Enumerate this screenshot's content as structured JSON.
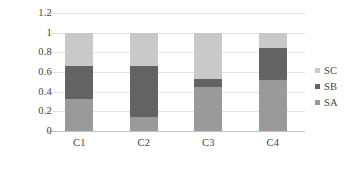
{
  "chart_data": {
    "type": "bar",
    "subtype": "stacked-bar",
    "title": "",
    "subtitle": "",
    "xlabel": "",
    "ylabel": "",
    "categories": [
      "C1",
      "C2",
      "C3",
      "C4"
    ],
    "series": [
      {
        "name": "SA",
        "color": "#9a9a9a",
        "values": [
          0.33,
          0.14,
          0.45,
          0.52
        ]
      },
      {
        "name": "SB",
        "color": "#636363",
        "values": [
          0.33,
          0.52,
          0.08,
          0.32
        ]
      },
      {
        "name": "SC",
        "color": "#c9c9c9",
        "values": [
          0.34,
          0.34,
          0.47,
          0.16
        ]
      }
    ],
    "stack_totals": [
      1.0,
      1.0,
      1.0,
      1.0
    ],
    "ylim": [
      0,
      1.2
    ],
    "ytick_values": [
      0,
      0.2,
      0.4,
      0.6,
      0.8,
      1,
      1.2
    ],
    "ytick_labels": [
      "0",
      "0.2",
      "0.4",
      "0.6",
      "0.8",
      "1",
      "1.2"
    ],
    "grid": true,
    "grid_color": "#e2e2e2",
    "legend": {
      "position": "right",
      "entries": [
        {
          "label": "SC",
          "color": "#c9c9c9",
          "marker": "square-swatch-icon"
        },
        {
          "label": "SB",
          "color": "#636363",
          "marker": "square-swatch-icon"
        },
        {
          "label": "SA",
          "color": "#9a9a9a",
          "marker": "square-swatch-icon"
        }
      ]
    },
    "background_color": "#ffffff",
    "axis_color": "#c3c3c3",
    "text_color": "#464646"
  }
}
